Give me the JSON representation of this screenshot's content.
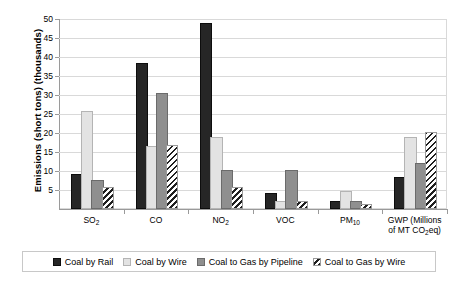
{
  "chart_data": {
    "type": "bar",
    "title": "",
    "xlabel": "",
    "ylabel": "Emissions (short tons) (thousands)",
    "ylim": [
      0,
      50
    ],
    "ytick_step": 5,
    "yticks": [
      50,
      45,
      40,
      35,
      30,
      25,
      20,
      15,
      10,
      5
    ],
    "grid": true,
    "legend_position": "bottom",
    "categories": [
      "SO₂",
      "CO",
      "NO₂",
      "VOC",
      "PM₁₀",
      "GWP (Millions of MT CO₂eq)"
    ],
    "category_labels_html": [
      "SO<sub>2</sub>",
      "CO",
      "NO<sub>2</sub>",
      "VOC",
      "PM<sub>10</sub>",
      "GWP (Millions<br>of MT CO<sub>2</sub>eq)"
    ],
    "series": [
      {
        "name": "Coal by Rail",
        "pattern": "solid-black",
        "color": "#262626",
        "values": [
          8.8,
          37.8,
          48.3,
          3.8,
          1.6,
          7.8
        ]
      },
      {
        "name": "Coal by Wire",
        "pattern": "solid-light-gray",
        "color": "#e3e3e3",
        "values": [
          25.3,
          16.0,
          18.5,
          1.6,
          4.3,
          18.5
        ]
      },
      {
        "name": "Coal to Gas by Pipeline",
        "pattern": "solid-mid-gray",
        "color": "#8f8f8f",
        "values": [
          7.0,
          30.0,
          9.8,
          9.8,
          1.7,
          11.5
        ]
      },
      {
        "name": "Coal to Gas by Wire",
        "pattern": "diagonal-hatch",
        "color": "#1f1f1f",
        "values": [
          5.3,
          16.3,
          5.2,
          1.7,
          0.9,
          19.8
        ]
      }
    ]
  },
  "axis": {
    "y_title": "Emissions (short tons) (thousands)"
  },
  "legend": {
    "items": [
      {
        "label": "Coal by Rail",
        "swatch": "solid-black-swatch"
      },
      {
        "label": "Coal by Wire",
        "swatch": "solid-light-gray-swatch"
      },
      {
        "label": "Coal to Gas by Pipeline",
        "swatch": "solid-mid-gray-swatch"
      },
      {
        "label": "Coal to Gas by Wire",
        "swatch": "diagonal-hatch-swatch"
      }
    ]
  }
}
